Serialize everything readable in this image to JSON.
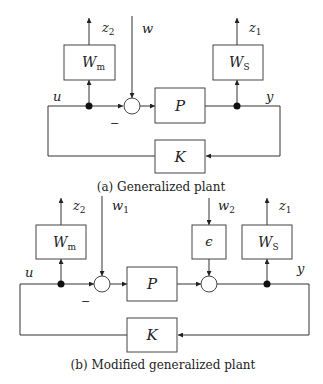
{
  "figure_a": {
    "caption": "(a) Generalized plant",
    "blocks": {
      "wm": {
        "label": "W",
        "sub": "m"
      },
      "ws": {
        "label": "W",
        "sub": "S"
      },
      "p": {
        "label": "P"
      },
      "k": {
        "label": "K"
      }
    },
    "signals": {
      "z2": {
        "label": "z",
        "sub": "2"
      },
      "z1": {
        "label": "z",
        "sub": "1"
      },
      "w": {
        "label": "w"
      },
      "u": {
        "label": "u"
      },
      "y": {
        "label": "y"
      },
      "minus": "−"
    }
  },
  "figure_b": {
    "caption": "(b) Modified generalized plant",
    "blocks": {
      "wm": {
        "label": "W",
        "sub": "m"
      },
      "ws": {
        "label": "W",
        "sub": "S"
      },
      "eps": {
        "label": "ϵ"
      },
      "p": {
        "label": "P"
      },
      "k": {
        "label": "K"
      }
    },
    "signals": {
      "z2": {
        "label": "z",
        "sub": "2"
      },
      "z1": {
        "label": "z",
        "sub": "1"
      },
      "w1": {
        "label": "w",
        "sub": "1"
      },
      "w2": {
        "label": "w",
        "sub": "2"
      },
      "u": {
        "label": "u"
      },
      "y": {
        "label": "y"
      },
      "minus": "−"
    }
  }
}
